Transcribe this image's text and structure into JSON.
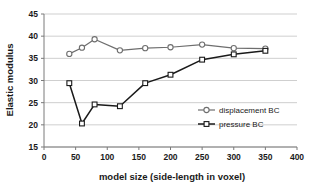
{
  "chart_data": {
    "type": "line",
    "title": "",
    "xlabel": "model size (side-length in voxel)",
    "ylabel": "Elastic modulus",
    "xlim": [
      0,
      400
    ],
    "ylim": [
      15,
      45
    ],
    "xticks": [
      "0",
      "50",
      "100",
      "150",
      "200",
      "250",
      "300",
      "350",
      "400"
    ],
    "xtick_values": [
      0,
      50,
      100,
      150,
      200,
      250,
      300,
      350,
      400
    ],
    "yticks": [
      "15",
      "20",
      "25",
      "30",
      "35",
      "40",
      "45"
    ],
    "ytick_values": [
      15,
      20,
      25,
      30,
      35,
      40,
      45
    ],
    "grid": "horizontal",
    "legend_position": "center-right",
    "series": [
      {
        "name": "displacement BC",
        "marker": "open-circle",
        "color": "#6e6e6e",
        "x": [
          40,
          60,
          80,
          120,
          160,
          200,
          250,
          300,
          350
        ],
        "values": [
          36.0,
          37.4,
          39.3,
          36.8,
          37.3,
          37.5,
          38.1,
          37.3,
          37.2
        ]
      },
      {
        "name": "pressure BC",
        "marker": "open-square",
        "color": "#1a1a1a",
        "x": [
          40,
          60,
          80,
          120,
          160,
          200,
          250,
          300,
          350
        ],
        "values": [
          29.4,
          20.3,
          24.6,
          24.2,
          29.4,
          31.3,
          34.7,
          35.9,
          36.7
        ]
      }
    ]
  },
  "legend": {
    "entries": [
      {
        "label": "displacement BC"
      },
      {
        "label": "pressure BC"
      }
    ]
  }
}
